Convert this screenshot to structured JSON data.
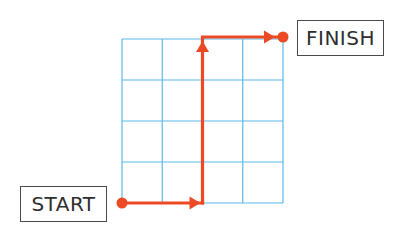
{
  "diagram": {
    "grid": {
      "columns": 4,
      "rows": 4,
      "line_color": "#5bb8ea"
    },
    "path": {
      "color": "#ec4a25",
      "start_cell": [
        0,
        0
      ],
      "segments": [
        {
          "direction": "right",
          "cells": 2
        },
        {
          "direction": "up",
          "cells": 4
        },
        {
          "direction": "right",
          "cells": 2
        }
      ],
      "waypoints": [
        [
          0,
          0
        ],
        [
          2,
          0
        ],
        [
          2,
          4
        ],
        [
          4,
          4
        ]
      ]
    },
    "labels": {
      "start": "START",
      "finish": "FINISH"
    }
  }
}
